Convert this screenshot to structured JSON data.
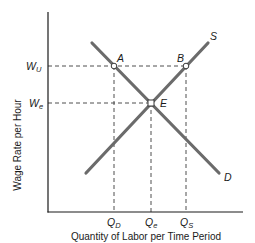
{
  "diagram": {
    "y_axis_label": "Wage Rate per Hour",
    "x_axis_label": "Quantity of Labor per Time Period",
    "y_ticks": [
      {
        "main": "W",
        "sub": "U",
        "id": "wu"
      },
      {
        "main": "W",
        "sub": "e",
        "id": "we"
      }
    ],
    "x_ticks": [
      {
        "main": "Q",
        "sub": "D",
        "id": "qd"
      },
      {
        "main": "Q",
        "sub": "e",
        "id": "qe"
      },
      {
        "main": "Q",
        "sub": "S",
        "id": "qs"
      }
    ],
    "curves": {
      "demand_label": "D",
      "supply_label": "S"
    },
    "points": {
      "a": "A",
      "b": "B",
      "e": "E"
    },
    "colors": {
      "axis": "#1a1a1a",
      "curve": "#6b6b6b",
      "dashed": "#3a3a3a",
      "point_fill": "#ffffff"
    }
  }
}
